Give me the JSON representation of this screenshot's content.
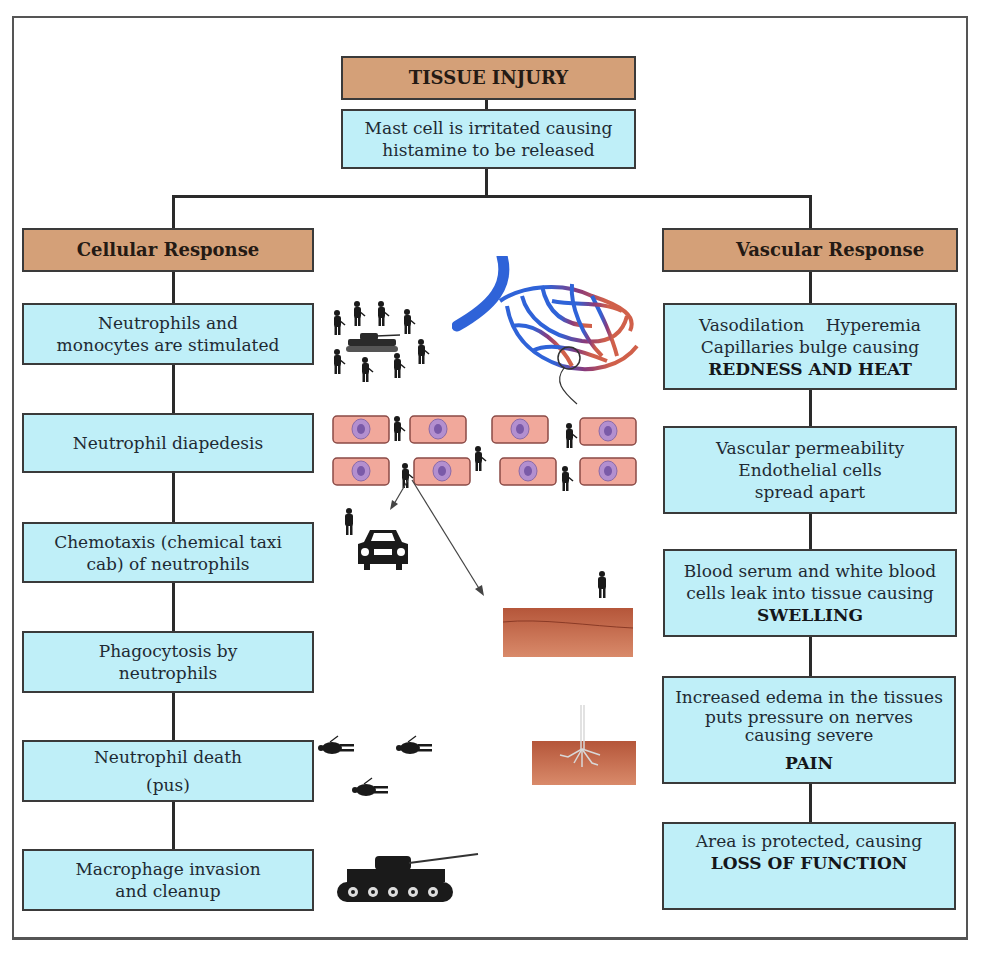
{
  "diagram": {
    "root": {
      "title": "TISSUE INJURY"
    },
    "trigger": {
      "line1": "Mast cell is irritated causing",
      "line2": "histamine to be released"
    },
    "cellular": {
      "header": "Cellular Response",
      "steps": [
        {
          "line1": "Neutrophils and",
          "line2": "monocytes are stimulated"
        },
        {
          "line1": "Neutrophil diapedesis",
          "line2": ""
        },
        {
          "line1": "Chemotaxis (chemical taxi",
          "line2": "cab) of neutrophils"
        },
        {
          "line1": "Phagocytosis by",
          "line2": "neutrophils"
        },
        {
          "line1": "Neutrophil death",
          "line2": "(pus)"
        },
        {
          "line1": "Macrophage invasion",
          "line2": "and cleanup"
        }
      ]
    },
    "vascular": {
      "header": "Vascular Response",
      "steps": [
        {
          "line1": "Vasodilation    Hyperemia",
          "line2": "Capillaries bulge causing",
          "emphasis": "REDNESS AND HEAT"
        },
        {
          "line1": "Vascular permeability",
          "line2": "Endothelial cells",
          "line3": "spread apart"
        },
        {
          "line1": "Blood serum and white blood",
          "line2": "cells leak into tissue causing",
          "emphasis": "SWELLING"
        },
        {
          "line1": "Increased edema in the tissues",
          "line2": "puts pressure on nerves",
          "line3": "causing severe",
          "emphasis": "PAIN"
        },
        {
          "line1": "Area is protected, causing",
          "emphasis": "LOSS OF FUNCTION"
        }
      ]
    },
    "illustrations": [
      "soldiers-and-tank-icon",
      "capillary-bed-icon",
      "endothelial-cells-with-soldiers-icon",
      "taxi-car-icon",
      "tissue-block-icon",
      "fallen-soldiers-icon",
      "nerve-in-tissue-icon",
      "tank-icon"
    ],
    "colors": {
      "header_fill": "#d4a078",
      "box_fill": "#bfeff8",
      "border": "#3a3a3a"
    }
  }
}
